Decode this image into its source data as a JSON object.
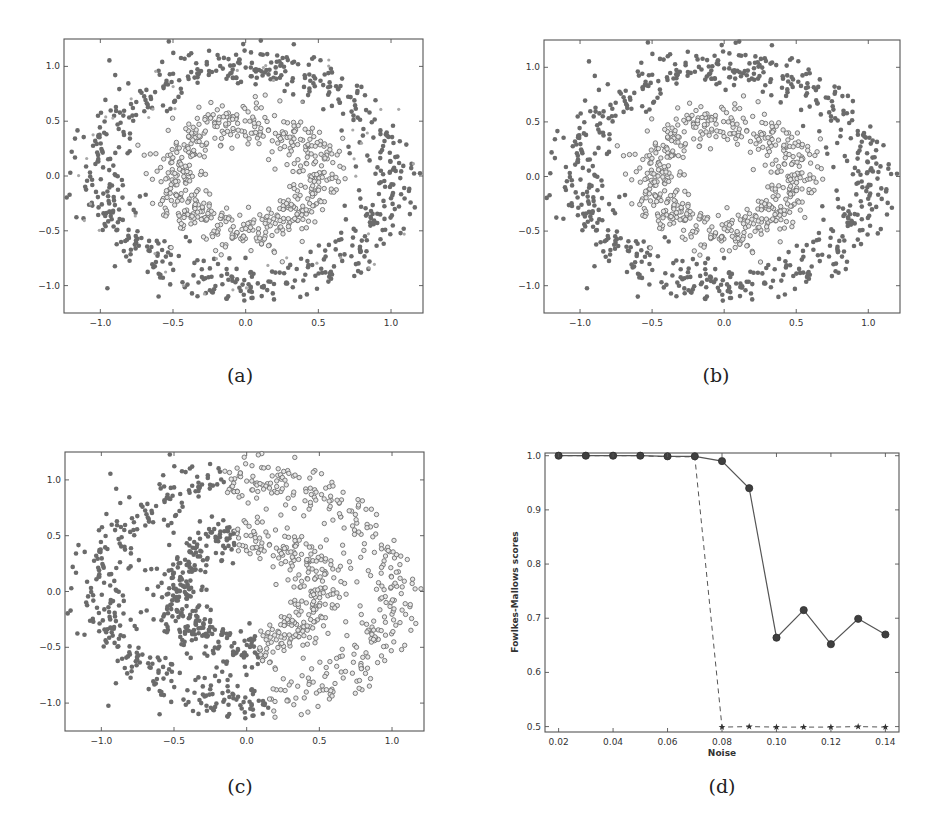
{
  "figure": {
    "captions": [
      "(a)",
      "(b)",
      "(c)",
      "(d)"
    ]
  },
  "colors": {
    "filled_marker": "#6b6b6b",
    "hollow_edge": "#6e6e6e",
    "hollow_face": "#e6e6e6",
    "noise_marker": "#a8a8a8",
    "line": "#555555",
    "frame": "#555555"
  },
  "chart_data": [
    {
      "id": "a",
      "type": "scatter",
      "title": "",
      "caption": "(a)",
      "xlabel": "",
      "ylabel": "",
      "xlim": [
        -1.25,
        1.22
      ],
      "ylim": [
        -1.25,
        1.25
      ],
      "xticks": [
        -1.0,
        -0.5,
        0.0,
        0.5,
        1.0
      ],
      "xtick_labels": [
        "−1.0",
        "−0.5",
        "0.0",
        "0.5",
        "1.0"
      ],
      "yticks": [
        -1.0,
        -0.5,
        0.0,
        0.5,
        1.0
      ],
      "ytick_labels": [
        "−1.0",
        "−0.5",
        "0.0",
        "0.5",
        "1.0"
      ],
      "grid": false,
      "dataset": "two concentric noisy rings",
      "series": [
        {
          "name": "outer ring cluster",
          "marker": "filled-circle",
          "ring_radius": 1.0,
          "noise": 0.1,
          "count": 620
        },
        {
          "name": "inner ring cluster",
          "marker": "hollow-circle",
          "ring_radius": 0.5,
          "noise": 0.1,
          "count": 560
        },
        {
          "name": "noise points",
          "marker": "small-light-dot",
          "count": 45
        }
      ],
      "split": "by-ring"
    },
    {
      "id": "b",
      "type": "scatter",
      "title": "",
      "caption": "(b)",
      "xlabel": "",
      "ylabel": "",
      "xlim": [
        -1.25,
        1.22
      ],
      "ylim": [
        -1.25,
        1.25
      ],
      "xticks": [
        -1.0,
        -0.5,
        0.0,
        0.5,
        1.0
      ],
      "xtick_labels": [
        "−1.0",
        "−0.5",
        "0.0",
        "0.5",
        "1.0"
      ],
      "yticks": [
        -1.0,
        -0.5,
        0.0,
        0.5,
        1.0
      ],
      "ytick_labels": [
        "−1.0",
        "−0.5",
        "0.0",
        "0.5",
        "1.0"
      ],
      "grid": false,
      "dataset": "two concentric noisy rings",
      "series": [
        {
          "name": "outer ring cluster",
          "marker": "filled-circle",
          "ring_radius": 1.0,
          "noise": 0.1,
          "count": 640
        },
        {
          "name": "inner ring cluster",
          "marker": "hollow-circle",
          "ring_radius": 0.5,
          "noise": 0.1,
          "count": 560
        }
      ],
      "split": "by-ring"
    },
    {
      "id": "c",
      "type": "scatter",
      "title": "",
      "caption": "(c)",
      "xlabel": "",
      "ylabel": "",
      "xlim": [
        -1.25,
        1.22
      ],
      "ylim": [
        -1.25,
        1.25
      ],
      "xticks": [
        -1.0,
        -0.5,
        0.0,
        0.5,
        1.0
      ],
      "xtick_labels": [
        "−1.0",
        "−0.5",
        "0.0",
        "0.5",
        "1.0"
      ],
      "yticks": [
        -1.0,
        -0.5,
        0.0,
        0.5,
        1.0
      ],
      "ytick_labels": [
        "−1.0",
        "−0.5",
        "0.0",
        "0.5",
        "1.0"
      ],
      "grid": false,
      "dataset": "two concentric noisy rings",
      "series": [
        {
          "name": "left half cluster",
          "marker": "filled-circle",
          "count": 600
        },
        {
          "name": "right half cluster",
          "marker": "hollow-circle",
          "count": 600
        }
      ],
      "split": "by-diagonal-half"
    },
    {
      "id": "d",
      "type": "line",
      "title": "",
      "caption": "(d)",
      "xlabel": "Noise",
      "ylabel": "Fowlkes-Mallows scores",
      "xlim": [
        0.015,
        0.145
      ],
      "ylim": [
        0.49,
        1.005
      ],
      "xticks": [
        0.02,
        0.04,
        0.06,
        0.08,
        0.1,
        0.12,
        0.14
      ],
      "xtick_labels": [
        "0.02",
        "0.04",
        "0.06",
        "0.08",
        "0.10",
        "0.12",
        "0.14"
      ],
      "yticks": [
        0.5,
        0.6,
        0.7,
        0.8,
        0.9,
        1.0
      ],
      "ytick_labels": [
        "0.5",
        "0.6",
        "0.7",
        "0.8",
        "0.9",
        "1.0"
      ],
      "grid": false,
      "legend": "none",
      "x": [
        0.02,
        0.03,
        0.04,
        0.05,
        0.06,
        0.07,
        0.08,
        0.09,
        0.1,
        0.11,
        0.12,
        0.13,
        0.14
      ],
      "series": [
        {
          "name": "solid-circle",
          "line_style": "solid",
          "marker": "circle",
          "values": [
            1.0,
            1.0,
            1.0,
            1.0,
            0.999,
            0.999,
            0.99,
            0.94,
            0.664,
            0.715,
            0.652,
            0.699,
            0.67
          ]
        },
        {
          "name": "dashed-star",
          "line_style": "dashed",
          "marker": "star",
          "values": [
            1.0,
            1.0,
            1.0,
            1.0,
            0.998,
            0.998,
            0.499,
            0.5,
            0.499,
            0.499,
            0.499,
            0.5,
            0.499
          ]
        }
      ]
    }
  ]
}
